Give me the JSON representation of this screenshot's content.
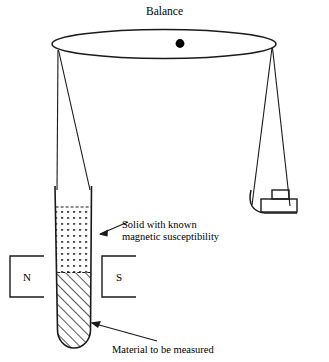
{
  "figure": {
    "title": "Balance",
    "background_color": "#ffffff",
    "ink_color": "#1a1a1a",
    "type": "scientific-apparatus-diagram"
  },
  "balance": {
    "beam_label": "Balance",
    "pivot_name": "pivot-point",
    "pivot_color": "#000000"
  },
  "sample_tube": {
    "upper_section": {
      "name": "known-solid-region",
      "fill_pattern": "dots"
    },
    "lower_section": {
      "name": "measured-material-region",
      "fill_pattern": "diagonal-hatch"
    }
  },
  "magnet": {
    "north_pole_label": "N",
    "south_pole_label": "S"
  },
  "counterweight": {
    "name": "counterweight-block"
  },
  "annotations": [
    {
      "id": "solid-known",
      "line1": "Solid with known",
      "line2": "magnetic susceptibility"
    },
    {
      "id": "material-measured",
      "line1": "Material to be measured",
      "line2": ""
    }
  ]
}
